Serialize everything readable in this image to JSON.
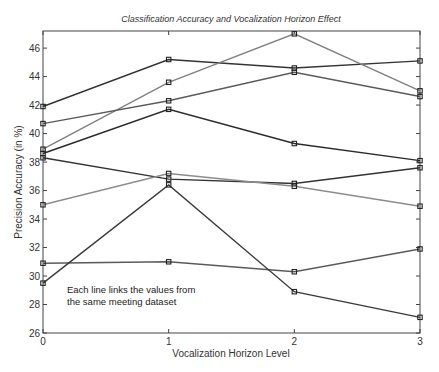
{
  "chart_data": {
    "type": "line",
    "title": "Classification Accuracy and Vocalization Horizon Effect",
    "xlabel": "Vocalization Horizon Level",
    "ylabel": "Precision Accuracy (in %)",
    "x": [
      0,
      1,
      2,
      3
    ],
    "x_ticks": [
      "0",
      "1",
      "2",
      "3"
    ],
    "xlim": [
      0,
      3
    ],
    "y_ticks": [
      "26",
      "28",
      "30",
      "32",
      "34",
      "36",
      "38",
      "40",
      "42",
      "44",
      "46"
    ],
    "ylim": [
      26,
      47.2
    ],
    "grid": false,
    "legend": null,
    "annotation": [
      "Each line links the values from",
      "the same meeting dataset"
    ],
    "marker": "square",
    "series": [
      {
        "name": "dataset-1",
        "color": "#333333",
        "values": [
          41.9,
          45.2,
          44.6,
          45.1
        ]
      },
      {
        "name": "dataset-2",
        "color": "#808080",
        "values": [
          38.9,
          43.6,
          47.0,
          43.0
        ]
      },
      {
        "name": "dataset-3",
        "color": "#5a5a5a",
        "values": [
          40.7,
          42.3,
          44.3,
          42.6
        ]
      },
      {
        "name": "dataset-4",
        "color": "#2a2a2a",
        "values": [
          38.6,
          41.7,
          39.3,
          38.1
        ]
      },
      {
        "name": "dataset-5",
        "color": "#333333",
        "values": [
          38.3,
          36.8,
          36.5,
          37.6
        ]
      },
      {
        "name": "dataset-6",
        "color": "#8c8c8c",
        "values": [
          35.0,
          37.2,
          36.3,
          34.9
        ]
      },
      {
        "name": "dataset-7",
        "color": "#5a5a5a",
        "values": [
          30.9,
          31.0,
          30.3,
          31.9
        ]
      },
      {
        "name": "dataset-8",
        "color": "#3a3a3a",
        "values": [
          29.5,
          36.4,
          28.9,
          27.1
        ]
      }
    ]
  }
}
